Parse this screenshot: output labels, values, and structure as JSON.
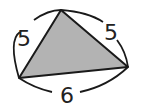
{
  "diagram": {
    "type": "triangle",
    "fill_color": "#b3b3b3",
    "stroke_color": "#1a1a1a",
    "sides": [
      {
        "label": "5",
        "position": "left"
      },
      {
        "label": "5",
        "position": "right"
      },
      {
        "label": "6",
        "position": "bottom"
      }
    ]
  }
}
